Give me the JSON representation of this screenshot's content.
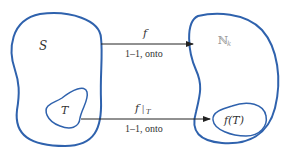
{
  "diagram": {
    "colors": {
      "set_outline": "#2f62ad",
      "arrow": "#222222",
      "text": "#333333",
      "nk_text": "#999999"
    },
    "left_set": {
      "label": "S"
    },
    "left_subset": {
      "label": "T"
    },
    "right_set": {
      "label": "ℕ",
      "subscript": "k"
    },
    "right_subset": {
      "label": "f(T)"
    },
    "top_arrow": {
      "label": "f",
      "caption": "1–1, onto"
    },
    "bottom_arrow": {
      "label": "f",
      "restriction": "|",
      "subscript": "T",
      "caption": "1–1, onto"
    }
  }
}
